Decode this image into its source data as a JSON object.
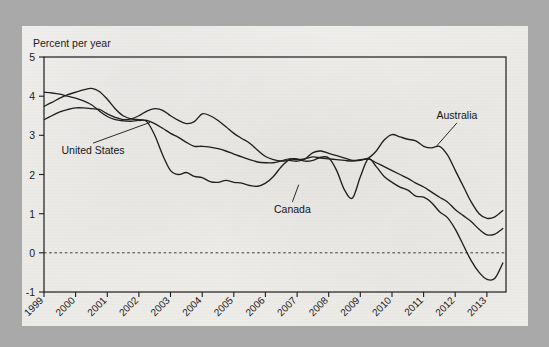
{
  "figure": {
    "background_color": "#a9a9a9",
    "paper_color": "#f0eeeb",
    "ink_color": "#20201f"
  },
  "chart_data": {
    "type": "line",
    "title": "",
    "subtitle": "",
    "ylabel": "Percent per year",
    "xlabel": "",
    "grid": false,
    "legend_position": "inline-annotations",
    "zero_reference_line": true,
    "ylim": [
      -1,
      5
    ],
    "yticks": [
      -1,
      0,
      1,
      2,
      3,
      4,
      5
    ],
    "ytick_labels": [
      "-1",
      "0",
      "1",
      "2",
      "3",
      "4",
      "5"
    ],
    "xlim": [
      1999,
      2013.6
    ],
    "xticks": [
      1999,
      2000,
      2001,
      2002,
      2003,
      2004,
      2005,
      2006,
      2007,
      2008,
      2009,
      2010,
      2011,
      2012,
      2013
    ],
    "xtick_labels": [
      "1999",
      "2000",
      "2001",
      "2002",
      "2003",
      "2004",
      "2005",
      "2006",
      "2007",
      "2008",
      "2009",
      "2010",
      "2011",
      "2012",
      "2013"
    ],
    "annotations": [
      {
        "text": "United  States",
        "label_x": 2000.55,
        "label_y": 2.52,
        "anchor_x": 2002.35,
        "anchor_y": 3.33
      },
      {
        "text": "Canada",
        "label_x": 2006.85,
        "label_y": 1.02,
        "anchor_x": 2007.05,
        "anchor_y": 1.74
      },
      {
        "text": "Australia",
        "label_x": 2012.05,
        "label_y": 3.42,
        "anchor_x": 2011.4,
        "anchor_y": 2.72
      }
    ],
    "series": [
      {
        "name": "United States",
        "x": [
          1999.0,
          1999.25,
          1999.5,
          1999.75,
          2000.0,
          2000.25,
          2000.5,
          2000.75,
          2001.0,
          2001.25,
          2001.5,
          2001.75,
          2002.0,
          2002.25,
          2002.5,
          2002.75,
          2003.0,
          2003.25,
          2003.5,
          2003.75,
          2004.0,
          2004.25,
          2004.5,
          2004.75,
          2005.0,
          2005.25,
          2005.5,
          2005.75,
          2006.0,
          2006.25,
          2006.5,
          2006.75,
          2007.0,
          2007.25,
          2007.5,
          2007.75,
          2008.0,
          2008.25,
          2008.5,
          2008.75,
          2009.0,
          2009.25,
          2009.5,
          2009.75,
          2010.0,
          2010.25,
          2010.5,
          2010.75,
          2011.0,
          2011.25,
          2011.5,
          2011.75,
          2012.0,
          2012.25,
          2012.5,
          2012.75,
          2013.0,
          2013.25,
          2013.5
        ],
        "values": [
          4.1,
          4.08,
          4.05,
          4.0,
          3.95,
          3.88,
          3.78,
          3.62,
          3.48,
          3.4,
          3.37,
          3.36,
          3.38,
          3.35,
          3.0,
          2.5,
          2.1,
          2.0,
          2.05,
          1.95,
          1.92,
          1.82,
          1.8,
          1.85,
          1.8,
          1.78,
          1.72,
          1.7,
          1.78,
          1.95,
          2.2,
          2.38,
          2.4,
          2.34,
          2.36,
          2.44,
          2.42,
          2.1,
          1.6,
          1.4,
          1.95,
          2.4,
          2.2,
          1.95,
          1.8,
          1.68,
          1.6,
          1.45,
          1.42,
          1.28,
          1.05,
          0.9,
          0.6,
          0.2,
          -0.2,
          -0.5,
          -0.68,
          -0.65,
          -0.26
        ],
        "end_value": -0.26,
        "min_value": -0.68,
        "max_value": 4.1
      },
      {
        "name": "Canada",
        "x": [
          1999.0,
          1999.25,
          1999.5,
          1999.75,
          2000.0,
          2000.25,
          2000.5,
          2000.75,
          2001.0,
          2001.25,
          2001.5,
          2001.75,
          2002.0,
          2002.25,
          2002.5,
          2002.75,
          2003.0,
          2003.25,
          2003.5,
          2003.75,
          2004.0,
          2004.25,
          2004.5,
          2004.75,
          2005.0,
          2005.25,
          2005.5,
          2005.75,
          2006.0,
          2006.25,
          2006.5,
          2006.75,
          2007.0,
          2007.25,
          2007.5,
          2007.75,
          2008.0,
          2008.25,
          2008.5,
          2008.75,
          2009.0,
          2009.25,
          2009.5,
          2009.75,
          2010.0,
          2010.25,
          2010.5,
          2010.75,
          2011.0,
          2011.25,
          2011.5,
          2011.75,
          2012.0,
          2012.25,
          2012.5,
          2012.75,
          2013.0,
          2013.25,
          2013.5
        ],
        "values": [
          3.74,
          3.84,
          3.95,
          4.04,
          4.1,
          4.16,
          4.2,
          4.12,
          3.92,
          3.68,
          3.5,
          3.42,
          3.4,
          3.38,
          3.3,
          3.18,
          3.05,
          2.95,
          2.82,
          2.72,
          2.72,
          2.7,
          2.66,
          2.6,
          2.52,
          2.45,
          2.38,
          2.32,
          2.3,
          2.3,
          2.35,
          2.4,
          2.38,
          2.4,
          2.45,
          2.42,
          2.4,
          2.38,
          2.36,
          2.34,
          2.36,
          2.4,
          2.3,
          2.2,
          2.1,
          2.0,
          1.9,
          1.78,
          1.68,
          1.55,
          1.42,
          1.3,
          1.1,
          0.95,
          0.8,
          0.6,
          0.46,
          0.48,
          0.62
        ],
        "end_value": 0.62,
        "min_value": 0.46,
        "max_value": 4.2
      },
      {
        "name": "Australia",
        "x": [
          1999.0,
          1999.25,
          1999.5,
          1999.75,
          2000.0,
          2000.25,
          2000.5,
          2000.75,
          2001.0,
          2001.25,
          2001.5,
          2001.75,
          2002.0,
          2002.25,
          2002.5,
          2002.75,
          2003.0,
          2003.25,
          2003.5,
          2003.75,
          2004.0,
          2004.25,
          2004.5,
          2004.75,
          2005.0,
          2005.25,
          2005.5,
          2005.75,
          2006.0,
          2006.25,
          2006.5,
          2006.75,
          2007.0,
          2007.25,
          2007.5,
          2007.75,
          2008.0,
          2008.25,
          2008.5,
          2008.75,
          2009.0,
          2009.25,
          2009.5,
          2009.75,
          2010.0,
          2010.25,
          2010.5,
          2010.75,
          2011.0,
          2011.25,
          2011.5,
          2011.75,
          2012.0,
          2012.25,
          2012.5,
          2012.75,
          2013.0,
          2013.25,
          2013.5
        ],
        "values": [
          3.4,
          3.5,
          3.6,
          3.66,
          3.7,
          3.7,
          3.68,
          3.66,
          3.55,
          3.46,
          3.4,
          3.42,
          3.5,
          3.62,
          3.68,
          3.64,
          3.5,
          3.38,
          3.3,
          3.35,
          3.55,
          3.5,
          3.38,
          3.22,
          3.05,
          2.92,
          2.8,
          2.62,
          2.46,
          2.38,
          2.34,
          2.36,
          2.34,
          2.4,
          2.56,
          2.6,
          2.54,
          2.48,
          2.42,
          2.36,
          2.38,
          2.42,
          2.6,
          2.88,
          3.02,
          2.96,
          2.9,
          2.86,
          2.72,
          2.68,
          2.72,
          2.5,
          2.1,
          1.7,
          1.3,
          1.0,
          0.88,
          0.92,
          1.08
        ],
        "end_value": 1.08,
        "min_value": 0.88,
        "max_value": 3.7
      }
    ]
  }
}
